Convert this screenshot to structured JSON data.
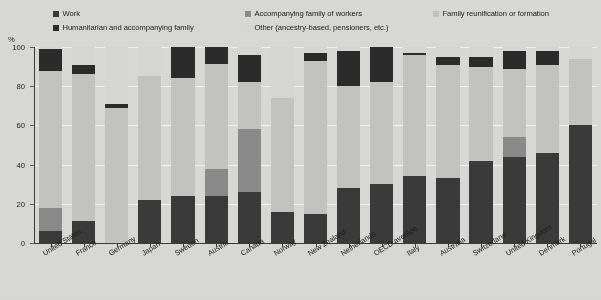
{
  "chart_data": {
    "type": "bar",
    "subtype": "stacked-bar",
    "title": "",
    "xlabel": "",
    "ylabel": "%",
    "ylim": [
      0,
      100
    ],
    "yticks": [
      0,
      20,
      40,
      60,
      80,
      100
    ],
    "grid": true,
    "legend_position": "top",
    "categories": [
      "United States",
      "France",
      "Germany",
      "Japan",
      "Sweden",
      "Austria",
      "Canada",
      "Norway",
      "New Zealand",
      "Netherlands",
      "OECD average",
      "Italy",
      "Australia",
      "Switzerland",
      "United Kingdom",
      "Denmark",
      "Portugal"
    ],
    "series": [
      {
        "name": "Work",
        "color": "#3a3a3a",
        "values": [
          6,
          11,
          0,
          22,
          24,
          24,
          26,
          16,
          15,
          28,
          30,
          34,
          33,
          42,
          44,
          46,
          60
        ]
      },
      {
        "name": "Accompanying family of workers",
        "color": "#8a8a8a",
        "values": [
          12,
          0,
          0,
          0,
          0,
          14,
          32,
          0,
          0,
          0,
          0,
          0,
          0,
          0,
          10,
          0,
          0
        ]
      },
      {
        "name": "Family reunification or formation",
        "color": "#c3c3c1",
        "values": [
          70,
          75,
          69,
          63,
          60,
          54,
          24,
          58,
          78,
          52,
          52,
          62,
          58,
          48,
          35,
          45,
          34
        ]
      },
      {
        "name": "Humanitarian and accompanying family",
        "color": "#2b2b2b",
        "values": [
          11,
          5,
          2,
          0,
          16,
          9,
          14,
          0,
          4,
          18,
          18,
          1,
          4,
          5,
          9,
          7,
          0
        ]
      },
      {
        "name": "Other (ancestry-based, pensioners, etc.)",
        "color": "#d6d6d4",
        "values": [
          1,
          9,
          29,
          15,
          0,
          0,
          4,
          26,
          3,
          2,
          0,
          3,
          5,
          5,
          2,
          2,
          6
        ]
      }
    ]
  },
  "legend": {
    "items": [
      {
        "label": "Work",
        "color": "#3a3a3a"
      },
      {
        "label": "Humanitarian and accompanying family",
        "color": "#2b2b2b"
      },
      {
        "label": "Accompanying family of workers",
        "color": "#8a8a8a"
      },
      {
        "label": "Other (ancestry-based, pensioners, etc.)",
        "color": "#d6d6d4"
      },
      {
        "label": "Family reunification or formation",
        "color": "#c3c3c1"
      }
    ]
  },
  "axes": {
    "y_unit": "%",
    "y_tick_labels": [
      "100",
      "80",
      "60",
      "40",
      "20",
      "0"
    ]
  },
  "colors": {
    "background": "#d8d8d6",
    "plot_background": "#d8d8d6",
    "gridline": "#f2f2f0",
    "axis": "#3a3a38",
    "text": "#1a1a1a"
  }
}
